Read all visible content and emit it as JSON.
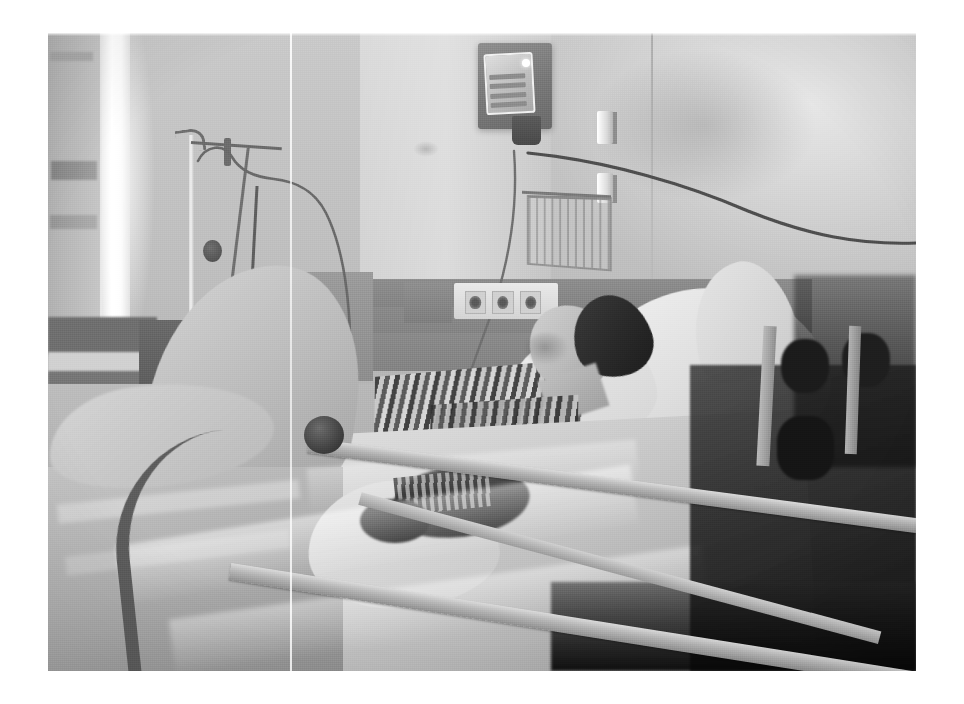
{
  "page": {
    "background_color": "#ffffff",
    "width": 964,
    "height": 704
  },
  "photo": {
    "alt_text": "Black and white photograph of a patient lying in a hospital bed",
    "color_mode": "grayscale",
    "frame": {
      "left": 48,
      "top": 33,
      "width": 868,
      "height": 638
    },
    "border_color": "#ffffff"
  },
  "scene": {
    "setting": "hospital patient room",
    "subject": "patient reclining in an adjustable hospital bed with raised side rails",
    "lighting": "bright daylight from a window at the left, deep shadow at the lower right"
  },
  "elements": {
    "wall": "plain light painted wall with a darker horizontal dado band",
    "window": "bright backlit window strip at far left",
    "curtain": "privacy curtain panel at the far left edge",
    "iv_pole": "IV stand with a top hook, clamp and hanging tubing",
    "wall_device": "wall-mounted medical device with an angled display screen and keypad",
    "wall_brackets": "two small white wall-mount brackets",
    "wire_basket": "wire basket rack attached to the wall",
    "outlets": "three round wall sockets on a white plate",
    "cable": "long dark cable running from the device across the wall to the right",
    "bed_rails": "metal side rails, a curved end rail with a round knob, and a diagonal support bar",
    "pillows": "stacked white pillows supporting the head and back",
    "linens": "white sheet and blanket draped over the patient's legs",
    "patient_gown": "striped pajama top"
  },
  "artifacts": {
    "scanline": "vertical white scan line running the full height of the photo",
    "grain": "visible halftone print grain across the whole image"
  },
  "palette": {
    "photo_highlight": "#ffffff",
    "photo_light": "#e6e6e6",
    "photo_mid": "#a8a8a8",
    "photo_dark": "#4a4a4a",
    "photo_shadow": "#141414"
  }
}
